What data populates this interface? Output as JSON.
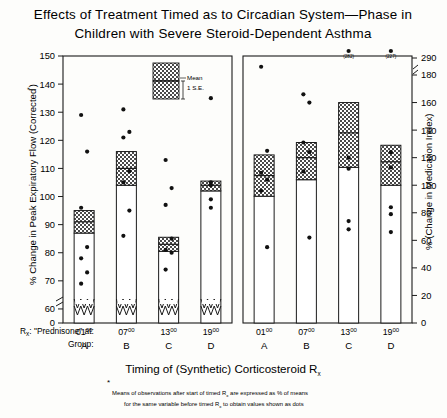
{
  "title": {
    "line1": "Effects of Treatment Timed as to Circadian System—Phase in",
    "line2": "Children with Severe Steroid-Dependent Asthma"
  },
  "axes": {
    "left_label_main": "% Change in Peak Expiratory Flow (Corrected",
    "left_label_star": "*",
    "left_label_close": ")",
    "right_label": "% (Change in Medication Index)",
    "left_ticks": [
      "150",
      "140",
      "130",
      "120",
      "110",
      "100",
      "90",
      "80",
      "70",
      "60",
      "0"
    ],
    "right_ticks": [
      "290",
      "180",
      "160",
      "140",
      "120",
      "100",
      "80",
      "60",
      "40",
      "20",
      "0"
    ]
  },
  "legend": {
    "mean": "Mean",
    "se": "1 S.E."
  },
  "xaxis": {
    "rx_label": "R",
    "rx_sub": "x",
    "rx_text": ": \"Prednisone\" at:",
    "group_label": "Group:",
    "times": [
      "01",
      "07",
      "13",
      "19"
    ],
    "time_sup": "00",
    "groups": [
      "A",
      "B",
      "C",
      "D"
    ]
  },
  "xtitle": {
    "text": "Timing of (Synthetic) Corticosteroid  R",
    "sub": "x"
  },
  "footnote": {
    "star": "*",
    "line1_a": "Means of observations after start of timed R",
    "line1_sub": "x",
    "line1_b": " are expressed as % of means",
    "line2_a": "for the same variable before timed R",
    "line2_sub": "x",
    "line2_b": " to obtain values shown as dots"
  },
  "chart_data": {
    "type": "bar",
    "title": "Effects of Treatment Timed as to Circadian System—Phase in Children with Severe Steroid-Dependent Asthma",
    "xlabel": "Timing of (Synthetic) Corticosteroid Rx",
    "grid": false,
    "legend_position": "inside-top",
    "panels": [
      {
        "name": "Peak Expiratory Flow",
        "ylabel": "% Change in Peak Expiratory Flow (Corrected*)",
        "ylim": [
          55,
          150
        ],
        "axis_break": true,
        "yticks": [
          60,
          70,
          80,
          90,
          100,
          110,
          120,
          130,
          140,
          150
        ],
        "categories": [
          "A",
          "B",
          "C",
          "D"
        ],
        "times": [
          "0100",
          "0700",
          "1300",
          "1900"
        ],
        "means": [
          91,
          110,
          83,
          104
        ],
        "se_upper": [
          95,
          116,
          85.5,
          105.5
        ],
        "se_lower": [
          87,
          104,
          80.5,
          102
        ],
        "dots": [
          [
            129,
            116,
            96,
            82,
            78,
            73,
            69
          ],
          [
            131,
            123,
            121,
            109,
            105,
            95,
            86
          ],
          [
            113,
            103,
            97,
            85,
            81,
            80,
            74
          ],
          [
            135,
            105,
            104,
            99,
            96
          ]
        ]
      },
      {
        "name": "Medication Index",
        "ylabel": "% (Change in Medication Index)",
        "ylim": [
          0,
          290
        ],
        "axis_break": true,
        "yticks": [
          0,
          20,
          40,
          60,
          80,
          100,
          120,
          140,
          160,
          180
        ],
        "categories": [
          "A",
          "B",
          "C",
          "D"
        ],
        "times": [
          "0100",
          "0700",
          "1300",
          "1900"
        ],
        "means": [
          107,
          120,
          138,
          117
        ],
        "se_upper": [
          122,
          131,
          160,
          129
        ],
        "se_lower": [
          92,
          104,
          113,
          100
        ],
        "dots": [
          [
            186,
            125,
            109,
            104,
            96,
            55
          ],
          [
            166,
            160,
            131,
            124,
            110,
            62
          ],
          [
            120,
            112,
            74,
            68
          ],
          [
            124,
            113,
            84,
            79,
            66
          ]
        ],
        "outliers": [
          {
            "label": "(282)",
            "group": "C",
            "value": 282
          },
          {
            "label": "(227)",
            "group": "D",
            "value": 227
          }
        ]
      }
    ]
  }
}
